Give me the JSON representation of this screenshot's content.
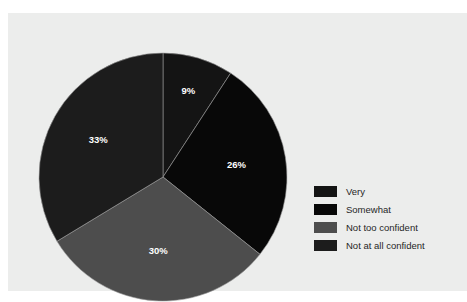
{
  "figure": {
    "background_color": "#ffffff",
    "panel_color": "#ecedec"
  },
  "chart_data": {
    "type": "pie",
    "title": "",
    "subtitle": "",
    "xlabel": "",
    "ylabel": "",
    "grid": false,
    "legend_position": "right",
    "start_angle_deg": 0,
    "direction": "clockwise",
    "categories": [
      "Very",
      "Somewhat",
      "Not too confident",
      "Not at all confident"
    ],
    "values": [
      9,
      26,
      30,
      33
    ],
    "value_labels": [
      "9%",
      "26%",
      "30%",
      "33%"
    ],
    "colors": [
      "#141414",
      "#080808",
      "#4d4d4d",
      "#1c1c1c"
    ],
    "slices": [
      {
        "label": "Very",
        "value": 9,
        "value_label": "9%",
        "color": "#141414",
        "label_color": "#ffffff"
      },
      {
        "label": "Somewhat",
        "value": 26,
        "value_label": "26%",
        "color": "#080808",
        "label_color": "#ffffff"
      },
      {
        "label": "Not too confident",
        "value": 30,
        "value_label": "30%",
        "color": "#4d4d4d",
        "label_color": "#ffffff"
      },
      {
        "label": "Not at all confident",
        "value": 33,
        "value_label": "33%",
        "color": "#1c1c1c",
        "label_color": "#ffffff"
      }
    ]
  },
  "legend": {
    "items": [
      {
        "label": "Very",
        "color": "#141414"
      },
      {
        "label": "Somewhat",
        "color": "#080808"
      },
      {
        "label": "Not too confident",
        "color": "#4d4d4d"
      },
      {
        "label": "Not at all confident",
        "color": "#1c1c1c"
      }
    ]
  }
}
